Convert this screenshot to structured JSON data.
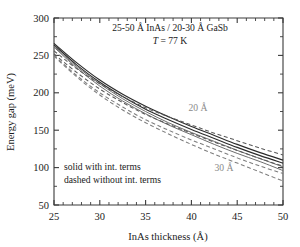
{
  "chart_data": {
    "type": "line",
    "title": "25-50 Å InAs / 20-30 Å GaSb",
    "subtitle": "T = 77 K",
    "subtitle_italic_prefix": "T",
    "subtitle_rest": " = 77 K",
    "xlabel": "InAs thickness (Å)",
    "ylabel": "Energy gap (meV)",
    "xlim": [
      25,
      50
    ],
    "ylim": [
      50,
      300
    ],
    "xticks": [
      25,
      30,
      35,
      40,
      45,
      50
    ],
    "yticks": [
      50,
      100,
      150,
      200,
      250,
      300
    ],
    "x_minor_count_per_interval": 4,
    "y_minor_count_per_interval": 1,
    "grid": "off",
    "legend_position": "lower-left-inside",
    "legend_entries": [
      "solid with int. terms",
      "dashed without int. terms"
    ],
    "annotations": [
      {
        "text": "20 Å",
        "x": 41.2,
        "y": 172,
        "color": "#8a8a8a"
      },
      {
        "text": "30 Å",
        "x": 44.6,
        "y": 118,
        "color": "#8a8a8a"
      }
    ],
    "x": [
      25,
      27.5,
      30,
      32.5,
      35,
      37.5,
      40,
      42.5,
      45,
      47.5,
      50
    ],
    "series": [
      {
        "name": "20 Å GaSb, with int. terms",
        "style": "solid",
        "shade": "dark",
        "values": [
          266,
          240,
          217,
          198,
          182,
          168,
          155,
          143,
          131,
          120,
          110
        ]
      },
      {
        "name": "25 Å GaSb, with int. terms",
        "style": "solid",
        "shade": "dark",
        "values": [
          264,
          237,
          214,
          195,
          178,
          164,
          151,
          139,
          127,
          116,
          106
        ]
      },
      {
        "name": "30 Å GaSb, with int. terms",
        "style": "solid",
        "shade": "mid",
        "values": [
          262,
          235,
          212,
          192,
          175,
          160,
          147,
          135,
          123,
          112,
          101
        ]
      },
      {
        "name": "30 Å GaSb, with int. terms (lower)",
        "style": "solid",
        "shade": "mid",
        "values": [
          261,
          233,
          209,
          189,
          172,
          157,
          144,
          131,
          119,
          108,
          96
        ]
      },
      {
        "name": "20 Å GaSb, without int. terms",
        "style": "dashed",
        "shade": "mid",
        "values": [
          256,
          232,
          212,
          195,
          180,
          168,
          157,
          146,
          136,
          126,
          117
        ]
      },
      {
        "name": "25 Å GaSb, without int. terms",
        "style": "dashed",
        "shade": "mid",
        "values": [
          252,
          227,
          205,
          187,
          171,
          158,
          146,
          134,
          123,
          112,
          102
        ]
      },
      {
        "name": "30 Å GaSb, without int. terms",
        "style": "dashed",
        "shade": "light",
        "values": [
          250,
          223,
          200,
          181,
          164,
          150,
          137,
          125,
          113,
          102,
          92
        ]
      },
      {
        "name": "30 Å GaSb, without int. terms (lower)",
        "style": "dashed",
        "shade": "light",
        "values": [
          249,
          221,
          197,
          177,
          160,
          145,
          131,
          118,
          106,
          94,
          82
        ]
      }
    ]
  },
  "axis": {
    "ylabel": "Energy gap (meV)",
    "xlabel": "InAs thickness (Å)",
    "ytick_labels": [
      "300",
      "250",
      "200",
      "150",
      "100",
      "50"
    ],
    "xtick_labels": [
      "25",
      "30",
      "35",
      "40",
      "45",
      "50"
    ]
  },
  "header": {
    "composition": "25-50 Å InAs / 20-30 Å GaSb",
    "temperature_symbol": "T",
    "temperature_value": " = 77 K"
  },
  "legend": {
    "line1": "solid with int. terms",
    "line2": "dashed without int. terms"
  },
  "curve_labels": {
    "upper": "20 Å",
    "lower": "30 Å"
  },
  "colors": {
    "axis": "#3a3a3a",
    "solid_curve": "#2b2b2b",
    "dashed_curve": "#5a5a5a",
    "curve_label": "#8a8a8a",
    "background": "#ffffff"
  }
}
